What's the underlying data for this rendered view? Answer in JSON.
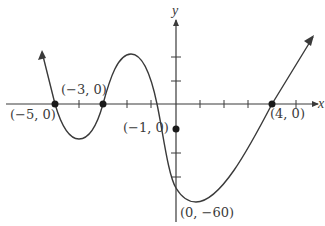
{
  "diagram": {
    "type": "polynomial-graph",
    "axes": {
      "x_label": "x",
      "y_label": "y",
      "x_ticks": [
        -6,
        -5,
        -4,
        -3,
        -2,
        -1,
        1,
        2,
        3,
        4,
        5
      ],
      "y_ticks_marks": 4
    },
    "points": [
      {
        "label": "(−5, 0)",
        "x": -5,
        "y": 0
      },
      {
        "label": "(−3, 0)",
        "x": -3,
        "y": 0
      },
      {
        "label": "(−1, 0)",
        "x": -1,
        "y": 0
      },
      {
        "label": "(4, 0)",
        "x": 4,
        "y": 0
      },
      {
        "label": "(0, −60)",
        "x": 0,
        "y": -60
      }
    ],
    "colors": {
      "curve": "#3a3a3a",
      "axis": "#3a3a3a",
      "background": "#ffffff"
    }
  }
}
